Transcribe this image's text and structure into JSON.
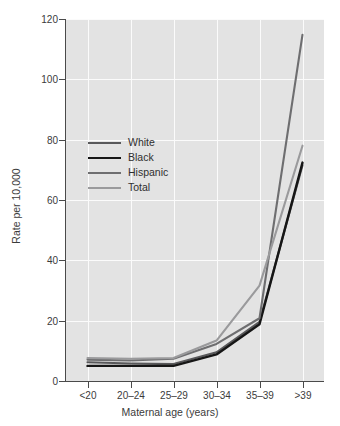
{
  "chart_data": {
    "type": "line",
    "title": "",
    "xlabel": "Maternal age (years)",
    "ylabel": "Rate per 10,000",
    "categories": [
      "<20",
      "20–24",
      "25–29",
      "30–34",
      "35–39",
      ">39"
    ],
    "ylim": [
      0,
      120
    ],
    "yticks": [
      0,
      20,
      40,
      60,
      80,
      100,
      120
    ],
    "ytick_labels": [
      "0",
      "20",
      "40",
      "60",
      "80",
      "100",
      "120"
    ],
    "grid": "both",
    "legend_position": "upper-left-inside",
    "series": [
      {
        "name": "White",
        "color": "#58585a",
        "width": 2.1,
        "values": [
          6.2,
          5.8,
          5.6,
          9.5,
          19.6,
          71.5
        ]
      },
      {
        "name": "Black",
        "color": "#161616",
        "width": 2.4,
        "values": [
          5.0,
          5.0,
          5.0,
          8.8,
          18.8,
          72.4
        ]
      },
      {
        "name": "Hispanic",
        "color": "#6e6e70",
        "width": 2.1,
        "values": [
          7.1,
          6.8,
          7.4,
          12.3,
          20.8,
          114.8
        ]
      },
      {
        "name": "Total",
        "color": "#9a9a9c",
        "width": 2.1,
        "values": [
          7.6,
          7.4,
          7.6,
          13.4,
          31.6,
          78.0
        ]
      }
    ]
  },
  "legend": {
    "items": [
      {
        "label": "White"
      },
      {
        "label": "Black"
      },
      {
        "label": "Hispanic"
      },
      {
        "label": "Total"
      }
    ]
  },
  "axes": {
    "x_title": "Maternal age (years)",
    "y_title": "Rate per 10,000"
  },
  "colors": {
    "plot_background": "#e3e3e3",
    "gridline": "#fbfbfb",
    "axis": "#4a4a4a",
    "text": "#3b3b3b",
    "figure_background": "#ffffff"
  }
}
